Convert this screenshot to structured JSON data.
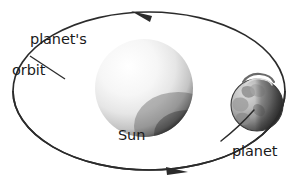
{
  "diagram": {
    "background_color": "#ffffff",
    "line_color": "#2b2b2b",
    "width": 300,
    "height": 182
  },
  "labels": {
    "orbit_line1": "planet's",
    "orbit_line2": "orbit",
    "sun": "Sun",
    "planet": "planet"
  },
  "bodies": {
    "sun": {
      "name": "Sun",
      "center_x": 144,
      "center_y": 88,
      "radius": 49,
      "highlight_color": "#ffffff",
      "mid_color": "#e3e3e3",
      "shadow_color": "#4a4a4a"
    },
    "planet": {
      "name": "planet",
      "center_x": 257,
      "center_y": 105,
      "radius": 26,
      "lit_color": "#c9c9c9",
      "dark_color": "#4f4f4f",
      "has_ring": true
    }
  },
  "orbit": {
    "type": "ellipse",
    "center_x": 149,
    "center_y": 91,
    "radius_x": 136,
    "radius_y": 79,
    "direction": "counterclockwise",
    "arrowheads": [
      {
        "position": "top",
        "x": 140,
        "y": 14,
        "points": "left"
      },
      {
        "position": "bottom",
        "x": 175,
        "y": 170,
        "points": "right"
      }
    ]
  },
  "leader_lines": [
    {
      "from_label": "planet's orbit",
      "x1": 30,
      "y1": 56,
      "x2": 64,
      "y2": 78
    },
    {
      "from_label": "planet",
      "x1": 222,
      "y1": 140,
      "x2": 253,
      "y2": 110
    }
  ]
}
